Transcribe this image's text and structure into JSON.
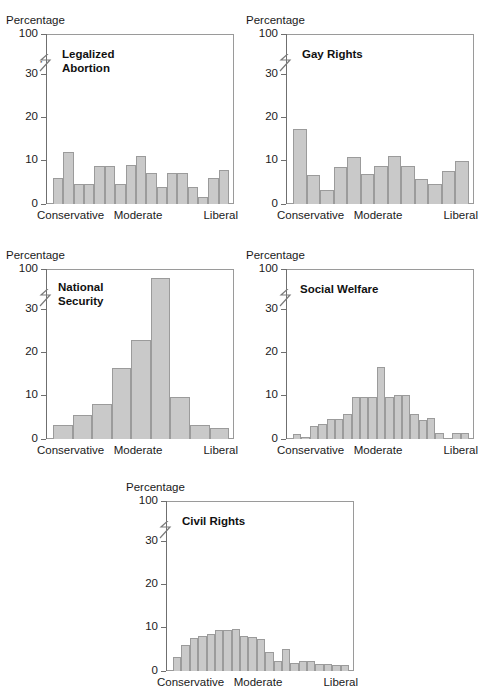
{
  "page": {
    "top_fragment": "Figure"
  },
  "common": {
    "y_axis_label": "Percentage",
    "y_ticks": [
      "100",
      "30",
      "20",
      "10",
      "0"
    ],
    "x_categories": [
      "Conservative",
      "Moderate",
      "Liberal"
    ],
    "bar_fill": "#c9c9c9",
    "bar_stroke": "#9b9b9b",
    "axis_color": "#6f6f6f",
    "axis_break_glyph": "⸺"
  },
  "chart_data": [
    {
      "id": "legalized-abortion",
      "type": "bar",
      "title": "Legalized\nAbortion",
      "ylabel": "Percentage",
      "xlabel": "",
      "yticks": [
        0,
        10,
        20,
        30,
        100
      ],
      "ylim": [
        0,
        36
      ],
      "grid": false,
      "legend": "none",
      "xticklabels": [
        "Conservative",
        "Moderate",
        "Liberal"
      ],
      "categories": [
        "1",
        "2",
        "3",
        "4",
        "5",
        "6",
        "7",
        "8",
        "9",
        "10",
        "11",
        "12",
        "13",
        "14",
        "15"
      ],
      "values": [
        5.5,
        11.0,
        4.2,
        4.2,
        8.0,
        8.0,
        4.2,
        8.2,
        10.2,
        6.5,
        3.5,
        6.5,
        6.5,
        3.5,
        1.5,
        5.5,
        7.2
      ]
    },
    {
      "id": "gay-rights",
      "type": "bar",
      "title": "Gay Rights",
      "ylabel": "Percentage",
      "xlabel": "",
      "yticks": [
        0,
        10,
        20,
        30,
        100
      ],
      "ylim": [
        0,
        36
      ],
      "grid": false,
      "legend": "none",
      "xticklabels": [
        "Conservative",
        "Moderate",
        "Liberal"
      ],
      "categories": [
        "1",
        "2",
        "3",
        "4",
        "5",
        "6",
        "7",
        "8",
        "9",
        "10",
        "11",
        "12"
      ],
      "values": [
        15.8,
        6.2,
        3.0,
        7.9,
        10.0,
        6.3,
        8.0,
        10.2,
        8.1,
        5.2,
        4.3,
        7.0,
        9.2
      ]
    },
    {
      "id": "national-security",
      "type": "bar",
      "title": "National\nSecurity",
      "ylabel": "Percentage",
      "xlabel": "",
      "yticks": [
        0,
        10,
        20,
        30,
        100
      ],
      "ylim": [
        0,
        36
      ],
      "grid": false,
      "legend": "none",
      "xticklabels": [
        "Conservative",
        "Moderate",
        "Liberal"
      ],
      "categories": [
        "1",
        "2",
        "3",
        "4",
        "5",
        "6",
        "7",
        "8",
        "9"
      ],
      "values": [
        3.0,
        5.0,
        7.5,
        15.0,
        21.0,
        34.0,
        9.0,
        3.0,
        2.3
      ]
    },
    {
      "id": "social-welfare",
      "type": "bar",
      "title": "Social Welfare",
      "ylabel": "Percentage",
      "xlabel": "",
      "yticks": [
        0,
        10,
        20,
        30,
        100
      ],
      "ylim": [
        0,
        36
      ],
      "grid": false,
      "legend": "none",
      "xticklabels": [
        "Conservative",
        "Moderate",
        "Liberal"
      ],
      "categories": [
        "1",
        "2",
        "3",
        "4",
        "5",
        "6",
        "7",
        "8",
        "9",
        "10",
        "11",
        "12",
        "13",
        "14",
        "15",
        "16",
        "17",
        "18",
        "19",
        "20"
      ],
      "values": [
        1.0,
        0.4,
        2.8,
        3.2,
        4.2,
        4.2,
        5.2,
        8.8,
        9.0,
        9.0,
        15.2,
        9.0,
        9.3,
        9.3,
        5.3,
        4.1,
        4.4,
        1.2,
        0.3,
        1.2,
        1.2
      ]
    },
    {
      "id": "civil-rights",
      "type": "bar",
      "title": "Civil Rights",
      "ylabel": "Percentage",
      "xlabel": "",
      "yticks": [
        0,
        10,
        20,
        30,
        100
      ],
      "ylim": [
        0,
        36
      ],
      "grid": false,
      "legend": "none",
      "xticklabels": [
        "Conservative",
        "Moderate",
        "Liberal"
      ],
      "categories": [
        "1",
        "2",
        "3",
        "4",
        "5",
        "6",
        "7",
        "8",
        "9",
        "10",
        "11",
        "12",
        "13",
        "14",
        "15",
        "16",
        "17",
        "18",
        "19",
        "20",
        "21",
        "22"
      ],
      "values": [
        3.0,
        5.5,
        7.0,
        7.5,
        7.8,
        8.7,
        8.6,
        8.8,
        7.4,
        7.3,
        6.7,
        4.1,
        2.2,
        4.6,
        1.8,
        2.1,
        2.1,
        1.5,
        1.4,
        1.2,
        1.2
      ]
    }
  ]
}
